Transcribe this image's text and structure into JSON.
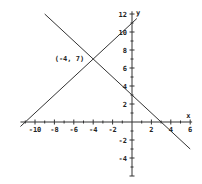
{
  "chart_data": {
    "type": "line",
    "title": "",
    "xlabel": "x",
    "ylabel": "y",
    "xlim": [
      -11.5,
      6
    ],
    "ylim": [
      -6,
      12
    ],
    "grid": false,
    "x_ticks": [
      -10,
      -8,
      -6,
      -4,
      -2,
      2,
      4,
      6
    ],
    "y_ticks": [
      -4,
      -2,
      2,
      4,
      6,
      8,
      10,
      12
    ],
    "series": [
      {
        "name": "line1",
        "equation": "y = x + 11",
        "x": [
          -11.5,
          0.5
        ],
        "y": [
          -0.5,
          11.5
        ]
      },
      {
        "name": "line2",
        "equation": "y = -x + 3",
        "x": [
          -9,
          6
        ],
        "y": [
          12,
          -3
        ]
      }
    ],
    "annotations": [
      {
        "text": "(-4, 7)",
        "x": -4,
        "y": 7
      }
    ]
  },
  "labels": {
    "x_axis": "x",
    "y_axis": "y",
    "intersection": "(-4, 7)"
  }
}
